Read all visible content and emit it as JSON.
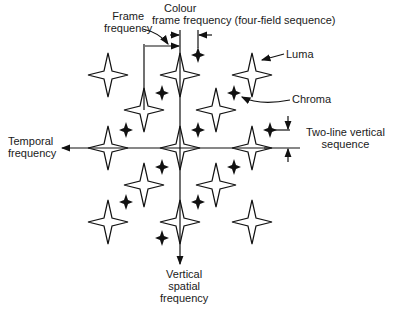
{
  "diagram": {
    "labels": {
      "frame_freq_1": "Frame",
      "frame_freq_2": "frequency",
      "colour_1": "Colour",
      "colour_2": "frame frequency (four-field sequence)",
      "luma": "Luma",
      "chroma": "Chroma",
      "temporal_1": "Temporal",
      "temporal_2": "frequency",
      "twoline_1": "Two-line vertical",
      "twoline_2": "sequence",
      "vertical_1": "Vertical",
      "vertical_2": "spatial",
      "vertical_3": "frequency"
    },
    "luma_stars": [
      [
        108,
        75
      ],
      [
        180,
        75
      ],
      [
        252,
        75
      ],
      [
        144,
        110
      ],
      [
        216,
        110
      ],
      [
        108,
        148
      ],
      [
        180,
        148
      ],
      [
        252,
        148
      ],
      [
        144,
        185
      ],
      [
        216,
        185
      ],
      [
        108,
        222
      ],
      [
        180,
        222
      ],
      [
        252,
        222
      ]
    ],
    "chroma_stars": [
      [
        198,
        55
      ],
      [
        162,
        93
      ],
      [
        234,
        93
      ],
      [
        126,
        130
      ],
      [
        198,
        130
      ],
      [
        270,
        130
      ],
      [
        162,
        167
      ],
      [
        234,
        167
      ],
      [
        126,
        202
      ],
      [
        198,
        202
      ],
      [
        162,
        238
      ]
    ]
  }
}
